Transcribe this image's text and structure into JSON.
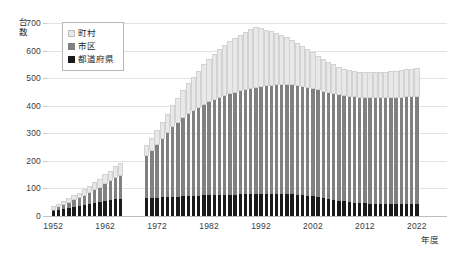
{
  "chart_data": {
    "type": "bar",
    "stacked": true,
    "title": "",
    "xlabel": "年度",
    "ylabel": "台数",
    "ylim": [
      0,
      700
    ],
    "ytick_values": [
      0,
      100,
      200,
      300,
      400,
      500,
      600,
      700
    ],
    "xtick_labels": [
      "1952",
      "1962",
      "1972",
      "1982",
      "1992",
      "2002",
      "2012",
      "2022"
    ],
    "grid": true,
    "legend_position": "top-left",
    "series": [
      {
        "name": "都道府県",
        "color": "#1a1a1a",
        "values": [
          18,
          22,
          26,
          30,
          33,
          36,
          40,
          44,
          47,
          50,
          54,
          57,
          60,
          62,
          null,
          null,
          null,
          null,
          65,
          66,
          67,
          68,
          68,
          69,
          70,
          71,
          72,
          73,
          74,
          75,
          76,
          76,
          77,
          77,
          78,
          78,
          79,
          79,
          79,
          80,
          80,
          80,
          80,
          80,
          80,
          80,
          79,
          78,
          76,
          74,
          71,
          68,
          65,
          62,
          59,
          56,
          53,
          51,
          49,
          47,
          46,
          45,
          44,
          44,
          43,
          43,
          43,
          43,
          43,
          43,
          43
        ]
      },
      {
        "name": "市区",
        "color": "#808080",
        "values": [
          9,
          13,
          17,
          22,
          27,
          32,
          38,
          44,
          50,
          57,
          65,
          72,
          80,
          88,
          null,
          null,
          null,
          null,
          158,
          175,
          195,
          215,
          236,
          256,
          272,
          288,
          300,
          312,
          322,
          332,
          340,
          348,
          356,
          362,
          368,
          372,
          377,
          381,
          385,
          389,
          392,
          394,
          396,
          397,
          398,
          398,
          398,
          397,
          396,
          395,
          394,
          392,
          390,
          388,
          387,
          386,
          385,
          385,
          385,
          386,
          387,
          387,
          388,
          388,
          389,
          389,
          390,
          390,
          391,
          392,
          394
        ]
      },
      {
        "name": "町村",
        "color": "#e8e8e8",
        "values": [
          4,
          5,
          7,
          9,
          11,
          13,
          15,
          18,
          21,
          24,
          28,
          32,
          36,
          40,
          null,
          null,
          null,
          null,
          32,
          38,
          46,
          55,
          64,
          74,
          84,
          95,
          106,
          117,
          128,
          139,
          149,
          159,
          168,
          176,
          184,
          191,
          197,
          203,
          209,
          214,
          206,
          198,
          190,
          182,
          174,
          166,
          158,
          150,
          142,
          134,
          126,
          118,
          111,
          105,
          100,
          96,
          93,
          90,
          88,
          87,
          86,
          86,
          86,
          87,
          88,
          89,
          90,
          92,
          94,
          96,
          98
        ]
      }
    ],
    "years": [
      1952,
      1953,
      1954,
      1955,
      1956,
      1957,
      1958,
      1959,
      1960,
      1961,
      1962,
      1963,
      1964,
      1965,
      1966,
      1967,
      1968,
      1969,
      1970,
      1971,
      1972,
      1973,
      1974,
      1975,
      1976,
      1977,
      1978,
      1979,
      1980,
      1981,
      1982,
      1983,
      1984,
      1985,
      1986,
      1987,
      1988,
      1989,
      1990,
      1991,
      1992,
      1993,
      1994,
      1995,
      1996,
      1997,
      1998,
      1999,
      2000,
      2001,
      2002,
      2003,
      2004,
      2005,
      2006,
      2007,
      2008,
      2009,
      2010,
      2011,
      2012,
      2013,
      2014,
      2015,
      2016,
      2017,
      2018,
      2019,
      2020,
      2021,
      2022
    ]
  },
  "legend": {
    "items": [
      {
        "label": "町村",
        "color": "#e8e8e8"
      },
      {
        "label": "市区",
        "color": "#808080"
      },
      {
        "label": "都道府県",
        "color": "#1a1a1a"
      }
    ]
  }
}
